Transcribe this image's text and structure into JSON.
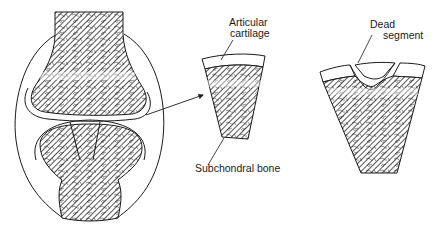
{
  "diagram": {
    "type": "anatomical-illustration",
    "panels": [
      {
        "id": "joint",
        "description": "Cross-section of synovial joint showing two bone ends within joint capsule; wedge marked on lower bone end"
      },
      {
        "id": "normal-segment",
        "description": "Enlarged wedge of articular cartilage over subchondral bone"
      },
      {
        "id": "dead-segment",
        "description": "Enlarged wedge showing separated dead segment of cartilage and bone"
      }
    ],
    "labels": {
      "articular_cartilage_line1": "Articular",
      "articular_cartilage_line2": "cartilage",
      "subchondral_bone": "Subchondral bone",
      "dead_segment_line1": "Dead",
      "dead_segment_line2": "segment"
    },
    "colors": {
      "stroke": "#1a1a1a",
      "fill_hatch": "#3a3a3a",
      "background": "#ffffff"
    }
  }
}
